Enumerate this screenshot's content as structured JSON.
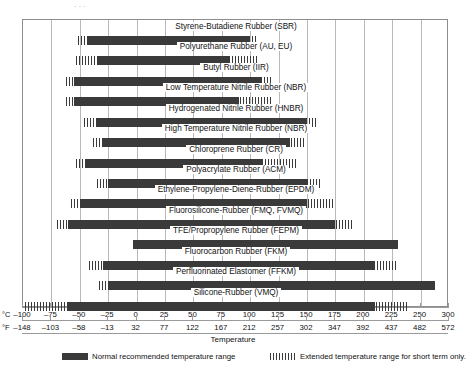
{
  "figure": {
    "axis_title": "Temperature",
    "unit_c": "°C",
    "unit_f": "°F",
    "top_cutoff_text": "·      ·      ·"
  },
  "legend": {
    "normal_label": "Normal recommended temperature range",
    "extended_label": "Extended temperature range for short term only.",
    "normal_color": "#3a3a3a",
    "extended_color": "#3a3a3a"
  },
  "chart_data": {
    "type": "bar",
    "orientation": "horizontal",
    "title": "",
    "xlabel": "Temperature",
    "ylabel": "",
    "xlim": [
      -100,
      300
    ],
    "grid": true,
    "legend_position": "bottom",
    "axes": {
      "celsius_ticks": [
        -100,
        -75,
        -50,
        -25,
        0,
        25,
        50,
        75,
        100,
        125,
        150,
        175,
        200,
        225,
        250,
        300
      ],
      "celsius_tick_labels": [
        "–100",
        "–75",
        "–50",
        "–25",
        "0",
        "25",
        "50",
        "75",
        "100",
        "125",
        "150",
        "175",
        "200",
        "225",
        "250",
        "300"
      ],
      "fahrenheit_tick_labels": [
        "–148",
        "–103",
        "–58",
        "–13",
        "32",
        "77",
        "122",
        "167",
        "212",
        "257",
        "302",
        "347",
        "392",
        "437",
        "482",
        "572"
      ]
    },
    "series_names": [
      "Normal recommended temperature range",
      "Extended temperature range for short term only."
    ],
    "categories": [
      "Styrene-Butadiene Rubber (SBR)",
      "Polyurethane Rubber (AU, EU)",
      "Butyl Rubber (IIR)",
      "Low Temperature Nitrile Rubber (NBR)",
      "Hydrogenated Nitrile Rubber (HNBR)",
      "High Temperature Nitrile Rubber (NBR)",
      "Chloroprene Rubber (CR)",
      "Polyacrylate Rubber (ACM)",
      "Ethylene-Propylene-Diene-Rubber (EPDM)",
      "Fluorosilicone-Rubber (FMQ, FVMQ)",
      "TFE/Propropylene Rubber (FEPM)",
      "Fluorocarbon Rubber (FKM)",
      "Perfluorinated Elastomer (FFKM)",
      "Silicone-Rubber (VMQ)"
    ],
    "rows": [
      {
        "label": "Styrene-Butadiene Rubber (SBR)",
        "normal": [
          -43,
          100
        ],
        "extended": [
          -52,
          107
        ]
      },
      {
        "label": "Polyurethane Rubber (AU, EU)",
        "normal": [
          -35,
          82
        ],
        "extended": [
          -53,
          107
        ]
      },
      {
        "label": "Butyl Rubber (IIR)",
        "normal": [
          -55,
          110
        ],
        "extended": [
          -62,
          118
        ]
      },
      {
        "label": "Low Temperature Nitrile Rubber (NBR)",
        "normal": [
          -55,
          90
        ],
        "extended": [
          -62,
          120
        ]
      },
      {
        "label": "Hydrogenated Nitrile Rubber (HNBR)",
        "normal": [
          -35,
          150
        ],
        "extended": [
          -46,
          160
        ]
      },
      {
        "label": "High Temperature Nitrile Rubber (NBR)",
        "normal": [
          -30,
          135
        ],
        "extended": [
          -38,
          148
        ]
      },
      {
        "label": "Chloroprene Rubber (CR)",
        "normal": [
          -45,
          110
        ],
        "extended": [
          -53,
          140
        ]
      },
      {
        "label": "Polyacrylate Rubber (ACM)",
        "normal": [
          -25,
          150
        ],
        "extended": [
          -35,
          162
        ]
      },
      {
        "label": "Ethylene-Propylene-Diene-Rubber (EPDM)",
        "normal": [
          -50,
          150
        ],
        "extended": [
          -58,
          175
        ]
      },
      {
        "label": "Fluorosilicone-Rubber (FMQ, FVMQ)",
        "normal": [
          -60,
          175
        ],
        "extended": [
          -70,
          190
        ]
      },
      {
        "label": "TFE/Propropylene Rubber (FEPM)",
        "normal": [
          -3,
          230
        ],
        "extended": [
          -3,
          230
        ]
      },
      {
        "label": "Fluorocarbon Rubber (FKM)",
        "normal": [
          -30,
          210
        ],
        "extended": [
          -42,
          230
        ]
      },
      {
        "label": "Perfluorinated Elastomer (FFKM)",
        "normal": [
          -25,
          275
        ],
        "extended": [
          -33,
          275
        ]
      },
      {
        "label": "Silicone-Rubber (VMQ)",
        "normal": [
          -60,
          210
        ],
        "extended": [
          -98,
          240
        ]
      }
    ]
  }
}
